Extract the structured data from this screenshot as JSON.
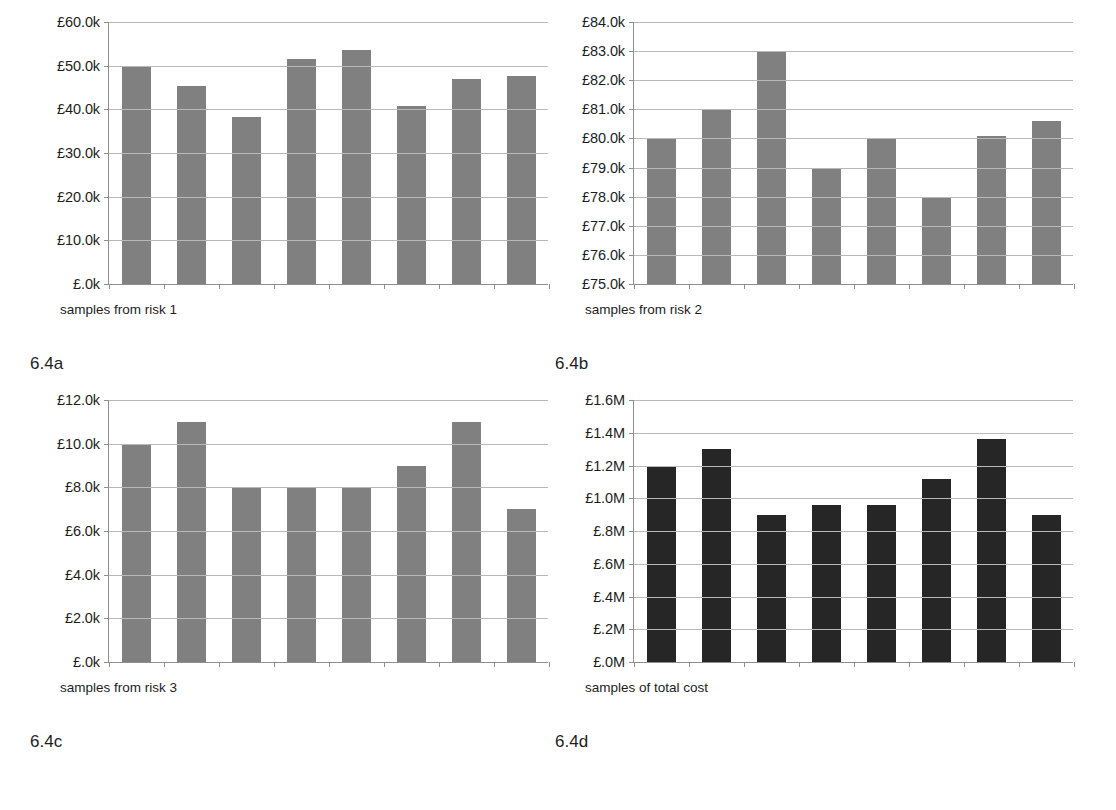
{
  "figure": {
    "panels": [
      {
        "key": "a",
        "fig_label": "6.4a",
        "x_caption": "samples from risk 1",
        "x_caption_left": 30,
        "bar_color": "#808080",
        "chart_data": {
          "type": "bar",
          "title": "",
          "xlabel": "samples from risk 1",
          "ylabel": "",
          "ylim": [
            0,
            60000
          ],
          "ytick_values": [
            0,
            10000,
            20000,
            30000,
            40000,
            50000,
            60000
          ],
          "ytick_labels": [
            "£.0k",
            "£10.0k",
            "£20.0k",
            "£30.0k",
            "£40.0k",
            "£50.0k",
            "£60.0k"
          ],
          "grid": true,
          "legend": "none",
          "categories": [
            "1",
            "2",
            "3",
            "4",
            "5",
            "6",
            "7",
            "8"
          ],
          "values": [
            50000,
            45300,
            38300,
            51500,
            53500,
            40700,
            47000,
            47700
          ]
        }
      },
      {
        "key": "b",
        "fig_label": "6.4b",
        "x_caption": "samples from risk 2",
        "x_caption_left": 30,
        "bar_color": "#808080",
        "chart_data": {
          "type": "bar",
          "title": "",
          "xlabel": "samples from risk 2",
          "ylabel": "",
          "ylim": [
            75000,
            84000
          ],
          "ytick_values": [
            75000,
            76000,
            77000,
            78000,
            79000,
            80000,
            81000,
            82000,
            83000,
            84000
          ],
          "ytick_labels": [
            "£75.0k",
            "£76.0k",
            "£77.0k",
            "£78.0k",
            "£79.0k",
            "£80.0k",
            "£81.0k",
            "£82.0k",
            "£83.0k",
            "£84.0k"
          ],
          "grid": true,
          "legend": "none",
          "categories": [
            "1",
            "2",
            "3",
            "4",
            "5",
            "6",
            "7",
            "8"
          ],
          "values": [
            80000,
            81000,
            83000,
            79000,
            80000,
            78000,
            80100,
            80600
          ]
        }
      },
      {
        "key": "c",
        "fig_label": "6.4c",
        "x_caption": "samples from risk 3",
        "x_caption_left": 30,
        "bar_color": "#808080",
        "chart_data": {
          "type": "bar",
          "title": "",
          "xlabel": "samples from risk 3",
          "ylabel": "",
          "ylim": [
            0,
            12000
          ],
          "ytick_values": [
            0,
            2000,
            4000,
            6000,
            8000,
            10000,
            12000
          ],
          "ytick_labels": [
            "£.0k",
            "£2.0k",
            "£4.0k",
            "£6.0k",
            "£8.0k",
            "£10.0k",
            "£12.0k"
          ],
          "grid": true,
          "legend": "none",
          "categories": [
            "1",
            "2",
            "3",
            "4",
            "5",
            "6",
            "7",
            "8"
          ],
          "values": [
            10000,
            11000,
            8000,
            8000,
            8000,
            9000,
            11000,
            7000
          ]
        }
      },
      {
        "key": "d",
        "fig_label": "6.4d",
        "x_caption": "samples of total  cost",
        "x_caption_left": 30,
        "bar_color": "#262626",
        "chart_data": {
          "type": "bar",
          "title": "",
          "xlabel": "samples of total  cost",
          "ylabel": "",
          "ylim": [
            0,
            1600000
          ],
          "ytick_values": [
            0,
            200000,
            400000,
            600000,
            800000,
            1000000,
            1200000,
            1400000,
            1600000
          ],
          "ytick_labels": [
            "£.0M",
            "£.2M",
            "£.4M",
            "£.6M",
            "£.8M",
            "£1.0M",
            "£1.2M",
            "£1.4M",
            "£1.6M"
          ],
          "grid": true,
          "legend": "none",
          "categories": [
            "1",
            "2",
            "3",
            "4",
            "5",
            "6",
            "7",
            "8"
          ],
          "values": [
            1200000,
            1300000,
            900000,
            960000,
            960000,
            1120000,
            1360000,
            900000
          ]
        }
      }
    ],
    "colors": {
      "bar_light": "#808080",
      "bar_dark": "#262626",
      "gridline": "#b9b9b9",
      "axis": "#8f8f8f",
      "text": "#1d1d1d"
    }
  }
}
